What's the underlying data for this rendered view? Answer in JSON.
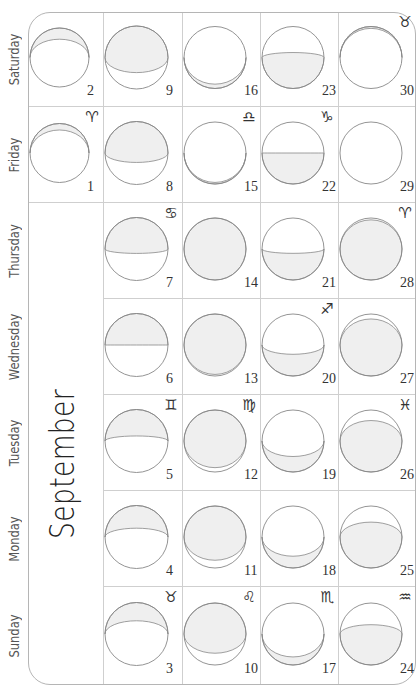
{
  "calendar": {
    "month": "September",
    "day_names": [
      "Sunday",
      "Monday",
      "Tuesday",
      "Wednesday",
      "Thursday",
      "Friday",
      "Saturday"
    ],
    "colors": {
      "frame": "#b5b5b5",
      "grid": "#cfcfcf",
      "moon_outline": "#888888",
      "moon_shade": "#efefef",
      "text": "#333333"
    },
    "weeks": [
      [
        null,
        null,
        null,
        null,
        null,
        {
          "day": "1",
          "sign": "♈",
          "sign_name": "aries",
          "shade": "right",
          "k": -0.78
        },
        {
          "day": "2",
          "sign": "",
          "shade": "right",
          "k": -0.62
        }
      ],
      [
        {
          "day": "3",
          "sign": "♉",
          "sign_name": "taurus",
          "shade": "right",
          "k": -0.42
        },
        {
          "day": "4",
          "sign": "",
          "shade": "right",
          "k": -0.28
        },
        {
          "day": "5",
          "sign": "♊",
          "sign_name": "gemini",
          "shade": "right",
          "k": -0.16
        },
        {
          "day": "6",
          "sign": "",
          "shade": "right",
          "k": 0.0
        },
        {
          "day": "7",
          "sign": "♋",
          "sign_name": "cancer",
          "shade": "right",
          "k": 0.14
        },
        {
          "day": "8",
          "sign": "",
          "shade": "right",
          "k": 0.3
        },
        {
          "day": "9",
          "sign": "",
          "shade": "right",
          "k": 0.48
        }
      ],
      [
        {
          "day": "10",
          "sign": "♌",
          "sign_name": "leo",
          "shade": "right",
          "k": 0.62
        },
        {
          "day": "11",
          "sign": "",
          "shade": "right",
          "k": 0.75
        },
        {
          "day": "12",
          "sign": "♍",
          "sign_name": "virgo",
          "shade": "right",
          "k": 0.86
        },
        {
          "day": "13",
          "sign": "",
          "shade": "right",
          "k": 0.95
        },
        {
          "day": "14",
          "sign": "",
          "shade": "full",
          "k": 1.0
        },
        {
          "day": "15",
          "sign": "♎",
          "sign_name": "libra",
          "shade": "left",
          "k": 0.95
        },
        {
          "day": "16",
          "sign": "",
          "shade": "left",
          "k": 0.86
        }
      ],
      [
        {
          "day": "17",
          "sign": "♏",
          "sign_name": "scorpio",
          "shade": "left",
          "k": 0.74
        },
        {
          "day": "18",
          "sign": "",
          "shade": "left",
          "k": 0.62
        },
        {
          "day": "19",
          "sign": "",
          "shade": "left",
          "k": 0.5
        },
        {
          "day": "20",
          "sign": "♐",
          "sign_name": "sagittarius",
          "shade": "left",
          "k": 0.3
        },
        {
          "day": "21",
          "sign": "",
          "shade": "left",
          "k": 0.14
        },
        {
          "day": "22",
          "sign": "♑",
          "sign_name": "capricorn",
          "shade": "left",
          "k": 0.0
        },
        {
          "day": "23",
          "sign": "",
          "shade": "left",
          "k": -0.16
        }
      ],
      [
        {
          "day": "24",
          "sign": "♒",
          "sign_name": "aquarius",
          "shade": "left",
          "k": -0.3
        },
        {
          "day": "25",
          "sign": "",
          "shade": "left",
          "k": -0.48
        },
        {
          "day": "26",
          "sign": "♓",
          "sign_name": "pisces",
          "shade": "left",
          "k": -0.66
        },
        {
          "day": "27",
          "sign": "",
          "shade": "left",
          "k": -0.84
        },
        {
          "day": "28",
          "sign": "♈",
          "sign_name": "aries",
          "shade": "left",
          "k": -0.94
        },
        {
          "day": "29",
          "sign": "",
          "shade": "none",
          "k": -1.0
        },
        {
          "day": "30",
          "sign": "♉",
          "sign_name": "taurus",
          "shade": "right",
          "k": -0.94
        }
      ]
    ]
  }
}
